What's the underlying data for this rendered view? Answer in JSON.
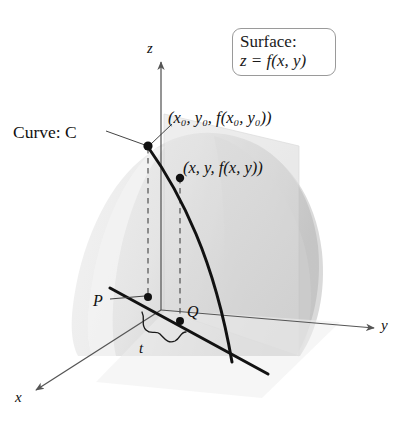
{
  "figure": {
    "kind": "3d-surface-diagram",
    "title_callout": {
      "line1": "Surface:",
      "line2": "z = f(x, y)"
    },
    "labels": {
      "curve": "Curve: C",
      "point_upper": "(x₀, y₀, f(x₀, y₀))",
      "point_lower": "(x, y, f(x, y))",
      "point_p": "P",
      "point_q": "Q",
      "parameter_t": "t"
    },
    "axes": {
      "z": "z",
      "y": "y",
      "x": "x"
    },
    "colors": {
      "surface_light": "#e9e9e9",
      "surface_mid": "#dcdcdc",
      "surface_dark": "#c9c9c9",
      "plane_fill": "#e0e0e0",
      "curve_stroke": "#111111",
      "axis_stroke": "#555555",
      "callout_border": "#9a9a9a",
      "page_background": "#ffffff"
    }
  }
}
